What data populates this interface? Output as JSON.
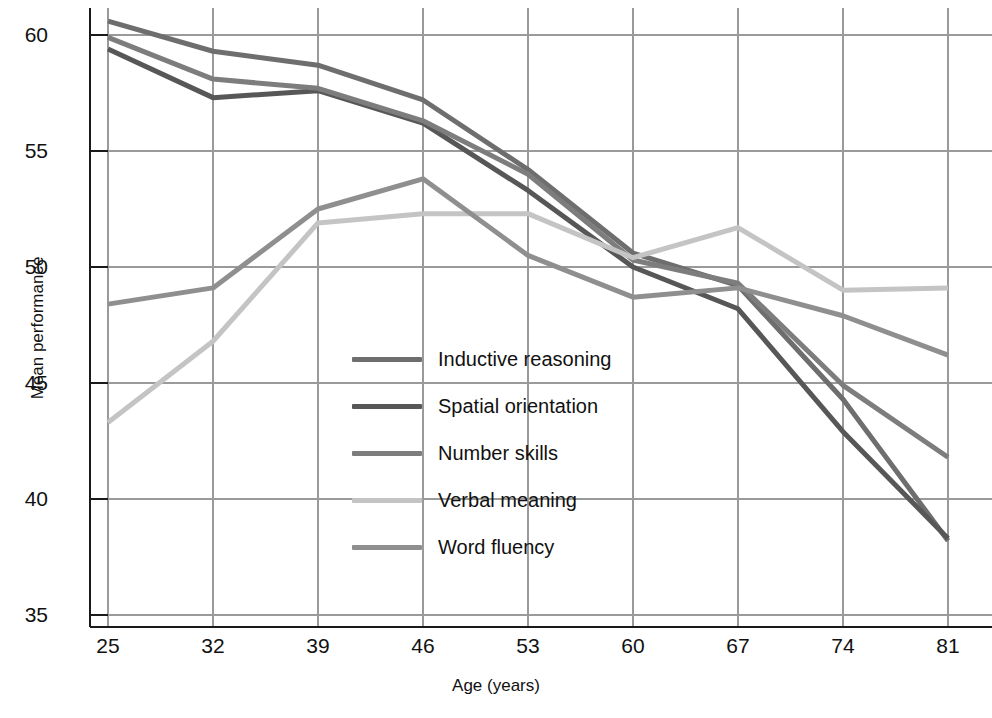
{
  "chart_data": {
    "type": "line",
    "title": "",
    "xlabel": "Age (years)",
    "ylabel": "Mean performance",
    "x": [
      25,
      32,
      39,
      46,
      53,
      60,
      67,
      74,
      81
    ],
    "xticklabels": [
      "25",
      "32",
      "39",
      "46",
      "53",
      "60",
      "67",
      "74",
      "81"
    ],
    "yticklabels": [
      "35",
      "40",
      "45",
      "50",
      "55",
      "60"
    ],
    "yticks": [
      35,
      40,
      45,
      50,
      55,
      60
    ],
    "xlim": [
      25,
      81
    ],
    "ylim": [
      34,
      61.5
    ],
    "grid": true,
    "legend_position": "center-left-inside",
    "series": [
      {
        "name": "Inductive reasoning",
        "color": "#6e6e6e",
        "values": [
          60.6,
          59.3,
          58.7,
          57.2,
          54.2,
          50.6,
          49.2,
          44.3,
          38.2
        ]
      },
      {
        "name": "Spatial orientation",
        "color": "#575757",
        "values": [
          59.4,
          57.3,
          57.6,
          56.2,
          53.3,
          50.0,
          48.2,
          42.9,
          38.3
        ]
      },
      {
        "name": "Number skills",
        "color": "#7d7d7d",
        "values": [
          59.9,
          58.1,
          57.7,
          56.3,
          54.0,
          50.3,
          49.3,
          44.9,
          41.8
        ]
      },
      {
        "name": "Verbal meaning",
        "color": "#c4c4c4",
        "values": [
          43.3,
          46.8,
          51.9,
          52.3,
          52.3,
          50.4,
          51.7,
          49.0,
          49.1
        ]
      },
      {
        "name": "Word fluency",
        "color": "#8f8f8f",
        "values": [
          48.4,
          49.1,
          52.5,
          53.8,
          50.5,
          48.7,
          49.1,
          47.9,
          46.2
        ]
      }
    ]
  },
  "axes": {
    "x_title": "Age (years)",
    "y_title": "Mean performance"
  },
  "legend": {
    "items": [
      {
        "label": "Inductive reasoning",
        "color": "#6e6e6e"
      },
      {
        "label": "Spatial orientation",
        "color": "#575757"
      },
      {
        "label": "Number skills",
        "color": "#7d7d7d"
      },
      {
        "label": "Verbal meaning",
        "color": "#c4c4c4"
      },
      {
        "label": "Word fluency",
        "color": "#8f8f8f"
      }
    ]
  },
  "colors": {
    "axis": "#1a1a1a",
    "grid": "#9a9a9a",
    "background": "#ffffff"
  }
}
